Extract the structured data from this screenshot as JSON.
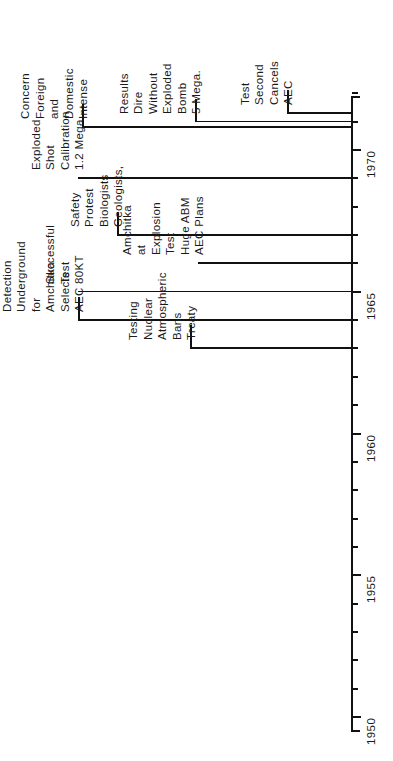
{
  "figure": {
    "type": "timeline",
    "orientation": "vertical-rotated",
    "title": ""
  },
  "axis": {
    "label": "Years",
    "range_start": 1949,
    "range_end": 1972,
    "major_ticks": [
      {
        "year": 1950,
        "label": "1950"
      },
      {
        "year": 1955,
        "label": "1955"
      },
      {
        "year": 1960,
        "label": "1960"
      },
      {
        "year": 1965,
        "label": "1965"
      },
      {
        "year": 1970,
        "label": "1970"
      }
    ],
    "minor_tick_years": [
      1951,
      1952,
      1953,
      1954,
      1956,
      1957,
      1958,
      1959,
      1961,
      1962,
      1963,
      1964,
      1966,
      1967,
      1968,
      1969,
      1971,
      1972
    ],
    "tick_color": "#111111"
  },
  "events": [
    {
      "id": "treaty-bans",
      "year": 1963,
      "lines": [
        "Treaty",
        "Bans",
        "Atmospheric",
        "Nuclear",
        "Testing"
      ]
    },
    {
      "id": "aec-selects-amchitka",
      "year": 1964,
      "lines": [
        "AEC",
        "Selects",
        "Amchitka",
        "for",
        "Underground",
        "Detection",
        "Test",
        "Explosion"
      ]
    },
    {
      "id": "80kt-test",
      "year": 1965,
      "lines": [
        "80KT",
        "Test",
        "Successful"
      ]
    },
    {
      "id": "aec-plans-huge-abm",
      "year": 1966,
      "lines": [
        "AEC  Plans",
        "Huge ABM",
        "Test",
        "Explosion",
        "at",
        "Amchitka"
      ]
    },
    {
      "id": "geologists-biologists-protest",
      "year": 1967,
      "lines": [
        "Geologists,",
        "Biologists",
        "Protest",
        "Safety"
      ]
    },
    {
      "id": "calibration-shot",
      "year": 1969,
      "lines": [
        "1.2 Mega.",
        "Calibration",
        "Shot",
        "Exploded"
      ]
    },
    {
      "id": "intense-concern",
      "year": 1970.8,
      "lines": [
        "Intense",
        "Domestic",
        "and",
        "Foreign",
        "Concern"
      ]
    },
    {
      "id": "5-mega-bomb",
      "year": 1971.0,
      "lines": [
        "5 Mega.",
        "Bomb",
        "Exploded",
        "Without",
        "Dire",
        "Results"
      ]
    },
    {
      "id": "aec-cancels-second-test",
      "year": 1971.3,
      "lines": [
        "AEC",
        "Cancels",
        "Second",
        "Test"
      ]
    }
  ],
  "colors": {
    "ink": "#111111",
    "background": "#ffffff"
  }
}
